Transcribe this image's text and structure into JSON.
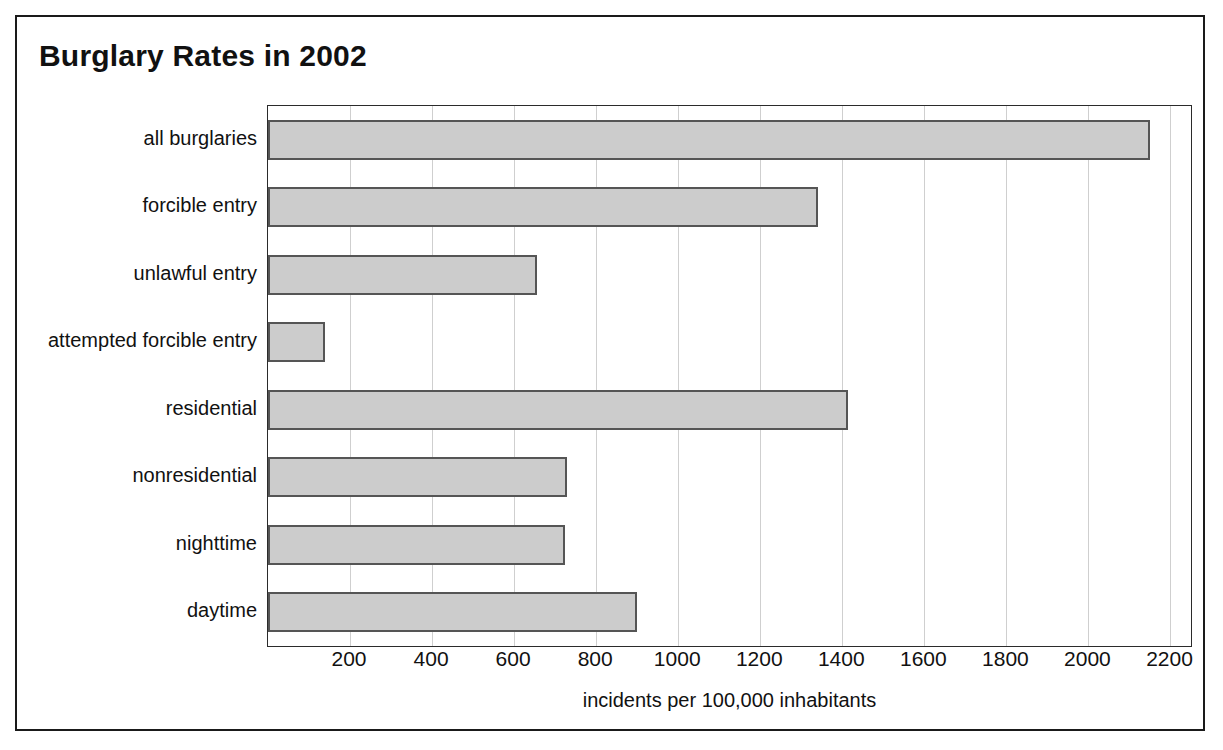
{
  "chart_data": {
    "type": "bar",
    "orientation": "horizontal",
    "title": "Burglary Rates in 2002",
    "xlabel": "incidents per 100,000 inhabitants",
    "ylabel": "",
    "categories": [
      "all burglaries",
      "forcible entry",
      "unlawful entry",
      "attempted forcible entry",
      "residential",
      "nonresidential",
      "nighttime",
      "daytime"
    ],
    "values": [
      2150,
      1340,
      655,
      140,
      1415,
      730,
      725,
      900
    ],
    "xlim": [
      0,
      2250
    ],
    "xticks": [
      200,
      400,
      600,
      800,
      1000,
      1200,
      1400,
      1600,
      1800,
      2000,
      2200
    ],
    "xtick_labels": [
      "200",
      "400",
      "600",
      "800",
      "1000",
      "1200",
      "1400",
      "1600",
      "1800",
      "2000",
      "2200"
    ],
    "grid": "vertical",
    "legend": null,
    "bar_fill_color": "#cccccc",
    "bar_edge_color": "#555555",
    "gridline_color": "#cfcfcf",
    "axis_color": "#2b2b2b",
    "frame_color": "#1a1a1a",
    "background_color": "#ffffff"
  }
}
